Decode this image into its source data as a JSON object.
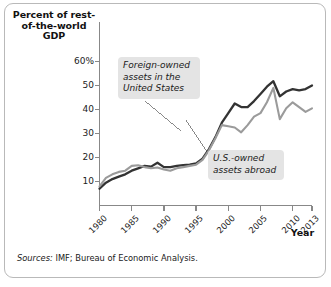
{
  "figure": {
    "source_label": "Sources:",
    "source_text": "IMF; Bureau of Economic Analysis."
  },
  "chart_data": {
    "type": "line",
    "title": "",
    "xlabel": "Year",
    "ylabel": "Percent of rest-of-the-world GDP",
    "ylabel_lines": "Percent of\nrest-of-the-world\nGDP",
    "xlim": [
      1980,
      2013
    ],
    "ylim": [
      0,
      60
    ],
    "grid": false,
    "legend": "annotations",
    "ytick_labels": [
      "60%",
      "50",
      "40",
      "30",
      "20",
      "10"
    ],
    "ytick_values": [
      60,
      50,
      40,
      30,
      20,
      10
    ],
    "xtick_labels": [
      "1980",
      "1985",
      "1990",
      "1995",
      "2000",
      "2005",
      "2010",
      "2013"
    ],
    "xtick_values": [
      1980,
      1985,
      1990,
      1995,
      2000,
      2005,
      2010,
      2013
    ],
    "x": [
      1980,
      1981,
      1982,
      1983,
      1984,
      1985,
      1986,
      1987,
      1988,
      1989,
      1990,
      1991,
      1992,
      1993,
      1994,
      1995,
      1996,
      1997,
      1998,
      1999,
      2000,
      2001,
      2002,
      2003,
      2004,
      2005,
      2006,
      2007,
      2008,
      2009,
      2010,
      2011,
      2012,
      2013
    ],
    "series": [
      {
        "name": "Foreign-owned assets in the United States",
        "color": "#333333",
        "values": [
          7.0,
          9.5,
          11.0,
          12.0,
          13.0,
          14.5,
          15.5,
          16.5,
          16.2,
          17.8,
          16.0,
          16.0,
          16.5,
          16.8,
          17.0,
          17.5,
          19.5,
          23.5,
          28.5,
          34.5,
          38.5,
          42.5,
          41.0,
          41.0,
          43.5,
          46.5,
          49.5,
          51.8,
          45.5,
          47.5,
          48.5,
          48.0,
          48.5,
          50.0
        ]
      },
      {
        "name": "U.S.-owned assets abroad",
        "color": "#9b9b9b",
        "values": [
          8.0,
          11.5,
          13.0,
          14.0,
          14.5,
          16.5,
          16.8,
          16.0,
          15.5,
          15.8,
          15.0,
          14.5,
          15.5,
          16.0,
          16.5,
          17.0,
          19.0,
          23.0,
          28.0,
          33.5,
          33.0,
          32.5,
          30.5,
          33.5,
          37.0,
          38.5,
          43.0,
          49.0,
          36.0,
          40.5,
          43.0,
          41.0,
          39.0,
          40.5
        ]
      }
    ],
    "annotations": [
      {
        "name": "foreign-owned",
        "text": "Foreign-owned\nassets in the\nUnited States",
        "points_to_series": "Foreign-owned assets in the United States"
      },
      {
        "name": "us-owned",
        "text": "U.S.-owned\nassets abroad",
        "points_to_series": "U.S.-owned assets abroad"
      }
    ]
  }
}
